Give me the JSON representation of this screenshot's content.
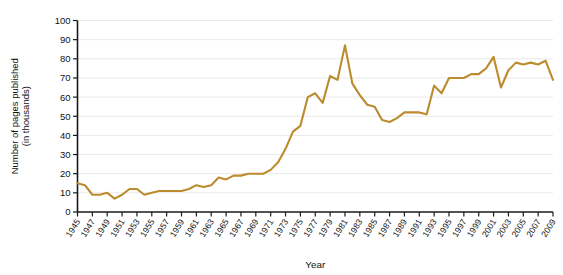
{
  "chart_data": {
    "type": "line",
    "title": "",
    "xlabel": "Year",
    "ylabel": "Number of pages published (in thousands)",
    "ylabel_line1": "Number of pages published",
    "ylabel_line2": "(in thousands)",
    "xlim": [
      1945,
      2009
    ],
    "ylim": [
      0,
      100
    ],
    "ytick_values": [
      0,
      10,
      20,
      30,
      40,
      50,
      60,
      70,
      80,
      90,
      100
    ],
    "ytick_labels": [
      "0",
      "10",
      "20",
      "30",
      "40",
      "50",
      "60",
      "70",
      "80",
      "90",
      "100"
    ],
    "xtick_labels": [
      "1945",
      "1947",
      "1949",
      "1951",
      "1953",
      "1955",
      "1957",
      "1959",
      "1961",
      "1963",
      "1965",
      "1967",
      "1969",
      "1971",
      "1973",
      "1975",
      "1977",
      "1979",
      "1981",
      "1983",
      "1985",
      "1987",
      "1989",
      "1991",
      "1993",
      "1995",
      "1997",
      "1999",
      "2001",
      "2003",
      "2005",
      "2007",
      "2009"
    ],
    "grid": true,
    "grid_axis": "y",
    "legend": "none",
    "line_color": "#bb8b2e",
    "x": [
      1945,
      1946,
      1947,
      1948,
      1949,
      1950,
      1951,
      1952,
      1953,
      1954,
      1955,
      1956,
      1957,
      1958,
      1959,
      1960,
      1961,
      1962,
      1963,
      1964,
      1965,
      1966,
      1967,
      1968,
      1969,
      1970,
      1971,
      1972,
      1973,
      1974,
      1975,
      1976,
      1977,
      1978,
      1979,
      1980,
      1981,
      1982,
      1983,
      1984,
      1985,
      1986,
      1987,
      1988,
      1989,
      1990,
      1991,
      1992,
      1993,
      1994,
      1995,
      1996,
      1997,
      1998,
      1999,
      2000,
      2001,
      2002,
      2003,
      2004,
      2005,
      2006,
      2007,
      2008,
      2009
    ],
    "values": [
      15,
      14,
      9,
      9,
      10,
      7,
      9,
      12,
      12,
      9,
      10,
      11,
      11,
      11,
      11,
      12,
      14,
      13,
      14,
      18,
      17,
      19,
      19,
      20,
      20,
      20,
      22,
      26,
      33,
      42,
      45,
      60,
      62,
      57,
      71,
      69,
      87,
      67,
      61,
      56,
      55,
      48,
      47,
      49,
      52,
      52,
      52,
      51,
      66,
      62,
      70,
      70,
      70,
      72,
      72,
      75,
      81,
      65,
      74,
      78,
      77,
      78,
      77,
      79,
      69
    ],
    "series": [
      {
        "name": "Pages published",
        "values": [
          15,
          14,
          9,
          9,
          10,
          7,
          9,
          12,
          12,
          9,
          10,
          11,
          11,
          11,
          11,
          12,
          14,
          13,
          14,
          18,
          17,
          19,
          19,
          20,
          20,
          20,
          22,
          26,
          33,
          42,
          45,
          60,
          62,
          57,
          71,
          69,
          87,
          67,
          61,
          56,
          55,
          48,
          47,
          49,
          52,
          52,
          52,
          51,
          66,
          62,
          70,
          70,
          70,
          72,
          72,
          75,
          81,
          65,
          74,
          78,
          77,
          78,
          77,
          79,
          69
        ]
      }
    ]
  },
  "figure": {
    "background_color": "#ffffff",
    "axis_color": "#1a1a1a",
    "grid_color": "#e9e9e9"
  }
}
